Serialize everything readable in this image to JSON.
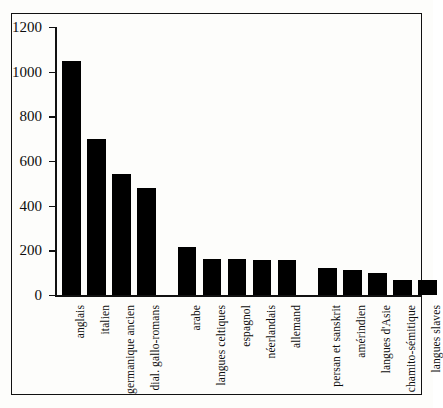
{
  "chart_data": {
    "type": "bar",
    "title": "",
    "subtitle": "",
    "xlabel": "",
    "ylabel": "",
    "ylim": [
      0,
      1200
    ],
    "yticks": [
      0,
      200,
      400,
      600,
      800,
      1000,
      1200
    ],
    "ytick_labels": [
      "0",
      "200",
      "400",
      "600",
      "800",
      "1000",
      "1200"
    ],
    "grid": false,
    "legend": null,
    "bar_color": "#000000",
    "background_color": "#fdfdfb",
    "axis_color": "#111111",
    "categories": [
      "anglais",
      "italien",
      "germanique ancien",
      "dial. gallo-romans",
      "arabe",
      "langues celtiques",
      "espagnol",
      "néerlandais",
      "allemand",
      "persan et sanskrit",
      "amérindien",
      "langues d'Asie",
      "chamito-sémitique",
      "langues slaves"
    ],
    "values": [
      1050,
      700,
      540,
      480,
      215,
      160,
      160,
      155,
      155,
      120,
      110,
      98,
      65,
      65
    ],
    "group_gaps_after": [
      3,
      8
    ]
  }
}
